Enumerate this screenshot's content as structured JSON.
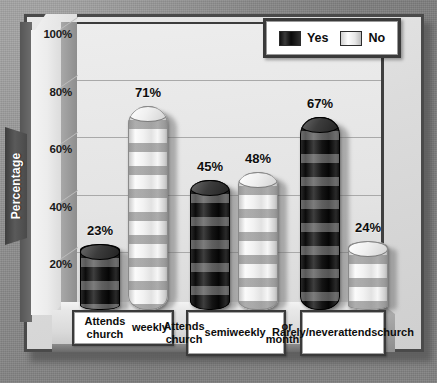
{
  "chart_data": {
    "type": "bar",
    "title": "",
    "subtitle": "",
    "xlabel": "",
    "ylabel": "Percentage",
    "ylim": [
      0,
      100
    ],
    "ytick_labels": [
      "100%",
      "80%",
      "60%",
      "40%",
      "20%",
      "0%"
    ],
    "ytick_values": [
      100,
      80,
      60,
      40,
      20,
      0
    ],
    "grid": true,
    "legend_position": "top-right",
    "value_suffix": "%",
    "categories": [
      "Attends church weekly",
      "Attends church semiweekly or monthly",
      "Rarely/never attends church"
    ],
    "category_lines": [
      [
        "Attends church",
        "weekly"
      ],
      [
        "Attends church",
        "semiweekly",
        "or monthly"
      ],
      [
        "Rarely/never",
        "attends",
        "church"
      ]
    ],
    "series": [
      {
        "name": "Yes",
        "color": "#111111",
        "values": [
          23,
          45,
          67
        ],
        "labels": [
          "23%",
          "45%",
          "67%"
        ]
      },
      {
        "name": "No",
        "color": "#f2f2f2",
        "values": [
          71,
          48,
          24
        ],
        "labels": [
          "71%",
          "48%",
          "24%"
        ]
      }
    ]
  },
  "legend": {
    "items": [
      {
        "label": "Yes",
        "swatch": "yes"
      },
      {
        "label": "No",
        "swatch": "no"
      }
    ]
  },
  "axis": {
    "y_label": "Percentage",
    "ticks": [
      "100%",
      "80%",
      "60%",
      "40%",
      "20%",
      "0%"
    ]
  },
  "bars": [
    {
      "group": 0,
      "series": "Yes",
      "label": "23%"
    },
    {
      "group": 0,
      "series": "No",
      "label": "71%"
    },
    {
      "group": 1,
      "series": "Yes",
      "label": "45%"
    },
    {
      "group": 1,
      "series": "No",
      "label": "48%"
    },
    {
      "group": 2,
      "series": "Yes",
      "label": "67%"
    },
    {
      "group": 2,
      "series": "No",
      "label": "24%"
    }
  ],
  "categories_display": [
    "Attends church\nweekly",
    "Attends church\nsemiweekly\nor monthly",
    "Rarely/never\nattends\nchurch"
  ]
}
